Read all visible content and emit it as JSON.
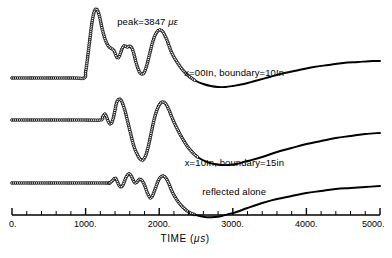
{
  "chart_data": {
    "type": "line",
    "title": "",
    "xlabel": "TIME (μs)",
    "ylabel": "",
    "xlim": [
      0,
      5000
    ],
    "xticks": [
      0,
      1000,
      2000,
      3000,
      4000,
      5000
    ],
    "xtick_labels": [
      "0.",
      "1000.",
      "2000.",
      "3000.",
      "4000.",
      "5000."
    ],
    "xminor_step": 200,
    "grid": false,
    "legend_position": "inline-annotations",
    "axis_style": "bottom-axis-only",
    "marker_style": "open-circle",
    "annotations": [
      {
        "name": "peak-annotation",
        "text": "peak=3847 με",
        "x": 1430,
        "y_px": 16
      }
    ],
    "series": [
      {
        "name": "x=00In, boundary=10In",
        "label": "x=00In, boundary=10In",
        "label_x": 3020,
        "label_y_px": 67,
        "baseline_px": 78,
        "marker_until_x": 2500,
        "points_x": [
          0,
          800,
          980,
          1000,
          1020,
          1040,
          1060,
          1080,
          1100,
          1120,
          1140,
          1160,
          1180,
          1200,
          1220,
          1240,
          1260,
          1280,
          1300,
          1320,
          1340,
          1360,
          1380,
          1400,
          1420,
          1440,
          1460,
          1480,
          1500,
          1520,
          1540,
          1560,
          1580,
          1600,
          1620,
          1640,
          1660,
          1680,
          1700,
          1720,
          1740,
          1760,
          1780,
          1800,
          1820,
          1840,
          1860,
          1880,
          1900,
          1920,
          1940,
          1960,
          1980,
          2000,
          2020,
          2040,
          2060,
          2080,
          2100,
          2120,
          2140,
          2160,
          2200,
          2260,
          2320,
          2400,
          2500,
          2600,
          2700,
          2800,
          2900,
          3000,
          3150,
          3300,
          3500,
          3700,
          3900,
          4100,
          4300,
          4500,
          4700,
          4900,
          5000
        ],
        "points_y_px": [
          78,
          78,
          78,
          72,
          62,
          50,
          38,
          26,
          17,
          11,
          9,
          10,
          14,
          20,
          27,
          33,
          38,
          42,
          45,
          47,
          48,
          49,
          50,
          53,
          57,
          58,
          56,
          52,
          48,
          46,
          46,
          47,
          47,
          46,
          47,
          50,
          55,
          61,
          66,
          70,
          73,
          74,
          74,
          72,
          68,
          63,
          57,
          51,
          45,
          40,
          36,
          33,
          31,
          30,
          30,
          31,
          33,
          36,
          39,
          43,
          47,
          51,
          57,
          64,
          70,
          76,
          81,
          84,
          86,
          87,
          87,
          86,
          84,
          81,
          77,
          73,
          70,
          67,
          65,
          63,
          62,
          61,
          61
        ]
      },
      {
        "name": "x=10In, boundary=15in",
        "label": "x=10In, boundary=15in",
        "label_x": 3020,
        "label_y_px": 157,
        "baseline_px": 120,
        "marker_until_x": 2520,
        "points_x": [
          0,
          900,
          1200,
          1230,
          1260,
          1280,
          1300,
          1320,
          1340,
          1360,
          1380,
          1400,
          1420,
          1440,
          1460,
          1480,
          1500,
          1520,
          1540,
          1560,
          1580,
          1600,
          1620,
          1640,
          1660,
          1680,
          1700,
          1720,
          1740,
          1760,
          1780,
          1800,
          1820,
          1840,
          1860,
          1880,
          1900,
          1920,
          1940,
          1960,
          1980,
          2000,
          2020,
          2040,
          2060,
          2080,
          2100,
          2120,
          2140,
          2160,
          2200,
          2260,
          2320,
          2400,
          2520,
          2650,
          2750,
          2850,
          2950,
          3050,
          3200,
          3400,
          3600,
          3800,
          4000,
          4200,
          4400,
          4600,
          4800,
          5000
        ],
        "points_y_px": [
          120,
          120,
          120,
          117,
          114,
          116,
          120,
          123,
          124,
          122,
          117,
          110,
          103,
          100,
          99,
          100,
          103,
          107,
          112,
          118,
          124,
          130,
          136,
          142,
          147,
          151,
          154,
          157,
          159,
          160,
          160,
          158,
          155,
          150,
          144,
          137,
          130,
          123,
          117,
          112,
          108,
          105,
          103,
          102,
          102,
          103,
          105,
          108,
          111,
          115,
          122,
          131,
          139,
          148,
          157,
          162,
          164,
          165,
          165,
          164,
          161,
          157,
          152,
          148,
          144,
          141,
          138,
          136,
          134,
          133
        ]
      },
      {
        "name": "reflected alone",
        "label": "reflected alone",
        "label_x": 3020,
        "label_y_px": 186,
        "baseline_px": 183,
        "marker_until_x": 2500,
        "points_x": [
          0,
          1200,
          1320,
          1360,
          1400,
          1420,
          1440,
          1460,
          1480,
          1500,
          1520,
          1540,
          1560,
          1580,
          1600,
          1620,
          1640,
          1660,
          1680,
          1700,
          1720,
          1740,
          1760,
          1780,
          1800,
          1820,
          1840,
          1860,
          1880,
          1900,
          1920,
          1940,
          1960,
          1980,
          2000,
          2020,
          2040,
          2060,
          2080,
          2100,
          2120,
          2140,
          2160,
          2200,
          2260,
          2320,
          2400,
          2500,
          2620,
          2750,
          2850,
          2950,
          3050,
          3200,
          3400,
          3600,
          3800,
          4000,
          4200,
          4400,
          4600,
          4800,
          5000
        ],
        "points_y_px": [
          183,
          183,
          183,
          181,
          178,
          180,
          183,
          186,
          187,
          186,
          183,
          179,
          176,
          174,
          174,
          176,
          179,
          182,
          183,
          182,
          180,
          179,
          180,
          182,
          185,
          189,
          193,
          196,
          198,
          197,
          194,
          190,
          186,
          182,
          179,
          177,
          176,
          176,
          177,
          179,
          182,
          185,
          189,
          195,
          202,
          207,
          212,
          215,
          217,
          217,
          216,
          214,
          212,
          208,
          203,
          199,
          196,
          193,
          191,
          189,
          188,
          187,
          186
        ]
      }
    ]
  },
  "axis": {
    "axis_line_y_px": 215,
    "plot_left_px": 12,
    "plot_right_px": 380
  }
}
